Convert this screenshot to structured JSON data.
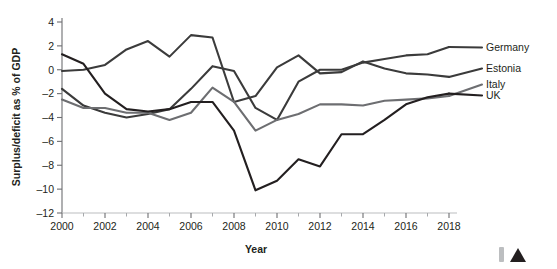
{
  "chart_data": {
    "type": "line",
    "title": "",
    "xlabel": "Year",
    "ylabel": "Surplus/deficit as % of GDP",
    "xlim": [
      2000,
      2018
    ],
    "ylim": [
      -12,
      4
    ],
    "ytick_step": 2,
    "xtick_step": 2,
    "x_minor_ticks": true,
    "grid": false,
    "legend_position": "right-inline",
    "x": [
      2000,
      2001,
      2002,
      2003,
      2004,
      2005,
      2006,
      2007,
      2008,
      2009,
      2010,
      2011,
      2012,
      2013,
      2014,
      2015,
      2016,
      2017,
      2018
    ],
    "yticks": [
      4,
      2,
      0,
      -2,
      -4,
      -6,
      -8,
      -10,
      -12
    ],
    "xticks": [
      2000,
      2002,
      2004,
      2006,
      2008,
      2010,
      2012,
      2014,
      2016,
      2018
    ],
    "series": [
      {
        "name": "Germany",
        "color": "#3b3b3b",
        "width": 2.1,
        "values": [
          -1.6,
          -3.0,
          -3.6,
          -4.0,
          -3.7,
          -3.3,
          -1.6,
          0.3,
          -0.1,
          -3.2,
          -4.2,
          -1.0,
          0.0,
          0.0,
          0.6,
          0.9,
          1.2,
          1.3,
          1.9
        ]
      },
      {
        "name": "Estonia",
        "color": "#3b3b3b",
        "width": 2.1,
        "values": [
          -0.1,
          0.0,
          0.4,
          1.7,
          2.4,
          1.1,
          2.9,
          2.7,
          -2.7,
          -2.2,
          0.2,
          1.2,
          -0.3,
          -0.2,
          0.7,
          0.1,
          -0.3,
          -0.4,
          -0.6
        ]
      },
      {
        "name": "Italy",
        "color": "#6d6e71",
        "width": 2.1,
        "values": [
          -2.5,
          -3.2,
          -3.2,
          -3.6,
          -3.6,
          -4.2,
          -3.6,
          -1.5,
          -2.7,
          -5.1,
          -4.2,
          -3.7,
          -2.9,
          -2.9,
          -3.0,
          -2.6,
          -2.5,
          -2.4,
          -2.2
        ]
      },
      {
        "name": "UK",
        "color": "#231f20",
        "width": 2.1,
        "values": [
          1.3,
          0.5,
          -2.0,
          -3.3,
          -3.5,
          -3.3,
          -2.7,
          -2.7,
          -5.1,
          -10.1,
          -9.3,
          -7.5,
          -8.1,
          -5.4,
          -5.4,
          -4.2,
          -2.9,
          -2.3,
          -2.0
        ]
      }
    ]
  },
  "axes": {
    "ylabel": "Surplus/deficit as % of GDP",
    "xlabel": "Year",
    "ytick_labels": [
      "4",
      "2",
      "0",
      "–2",
      "–4",
      "–6",
      "–8",
      "–10",
      "–12"
    ],
    "xtick_labels": [
      "2000",
      "2002",
      "2004",
      "2006",
      "2008",
      "2010",
      "2012",
      "2014",
      "2016",
      "2018"
    ]
  },
  "legend": {
    "entries": [
      {
        "label": "Germany"
      },
      {
        "label": "Estonia"
      },
      {
        "label": "Italy"
      },
      {
        "label": "UK"
      }
    ]
  },
  "footer_marks": {
    "bar_color": "#bcbec0",
    "triangle_color": "#231f20"
  }
}
